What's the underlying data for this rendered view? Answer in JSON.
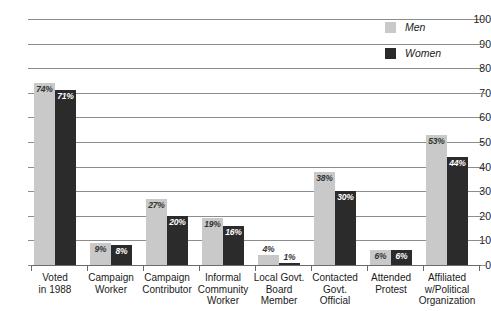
{
  "chart_data": {
    "type": "bar",
    "title": "",
    "subtitle": "",
    "xlabel": "",
    "ylabel": "",
    "ylim": [
      0,
      100
    ],
    "yticks": [
      0,
      10,
      20,
      30,
      40,
      50,
      60,
      70,
      80,
      90,
      100
    ],
    "grid": "horizontal",
    "legend_position": "top-right",
    "categories": [
      "Voted\nin 1988",
      "Campaign\nWorker",
      "Campaign\nContributor",
      "Informal\nCommunity\nWorker",
      "Local Govt.\nBoard\nMember",
      "Contacted\nGovt.\nOfficial",
      "Attended\nProtest",
      "Affiliated\nw/Political\nOrganization"
    ],
    "series": [
      {
        "name": "Men",
        "color": "#c9c9c9",
        "values": [
          74,
          9,
          27,
          19,
          4,
          38,
          6,
          53
        ],
        "labels": [
          "74%",
          "9%",
          "27%",
          "19%",
          "4%",
          "38%",
          "6%",
          "53%"
        ]
      },
      {
        "name": "Women",
        "color": "#2b2b2b",
        "values": [
          71,
          8,
          20,
          16,
          1,
          30,
          6,
          44
        ],
        "labels": [
          "71%",
          "8%",
          "20%",
          "16%",
          "1%",
          "30%",
          "6%",
          "44%"
        ]
      }
    ]
  },
  "axis": {
    "ytick_labels": [
      "100",
      "90",
      "80",
      "70",
      "60",
      "50",
      "40",
      "30",
      "20",
      "10",
      "0"
    ]
  },
  "legend": {
    "items": [
      {
        "label": "Men",
        "swatch": "men-swatch"
      },
      {
        "label": "Women",
        "swatch": "women-swatch"
      }
    ]
  },
  "categories_display": [
    {
      "lines": [
        "Voted",
        "in 1988"
      ]
    },
    {
      "lines": [
        "Campaign",
        "Worker"
      ]
    },
    {
      "lines": [
        "Campaign",
        "Contributor"
      ]
    },
    {
      "lines": [
        "Informal",
        "Community",
        "Worker"
      ]
    },
    {
      "lines": [
        "Local Govt.",
        "Board",
        "Member"
      ]
    },
    {
      "lines": [
        "Contacted",
        "Govt.",
        "Official"
      ]
    },
    {
      "lines": [
        "Attended",
        "Protest"
      ]
    },
    {
      "lines": [
        "Affiliated",
        "w/Political",
        "Organization"
      ]
    }
  ]
}
